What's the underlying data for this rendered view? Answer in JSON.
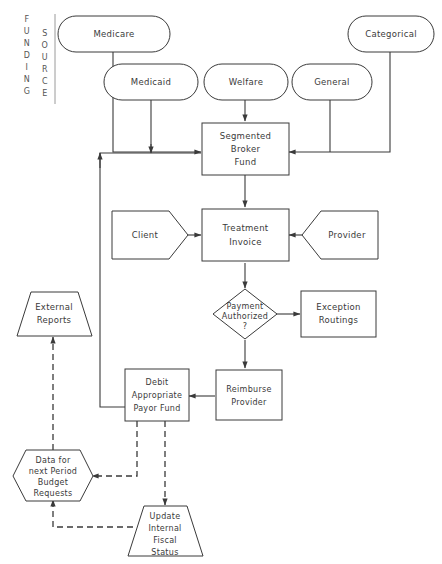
{
  "diagram": {
    "banner": {
      "line1": "FUNDING",
      "line2": "SOURCE"
    },
    "colors": {
      "stroke": "#3a3a3a",
      "fill": "#ffffff",
      "banner_text": "#555555"
    },
    "nodes": {
      "medicare": {
        "label": "Medicare",
        "shape": "pill"
      },
      "medicaid": {
        "label": "Medicaid",
        "shape": "pill"
      },
      "welfare": {
        "label": "Welfare",
        "shape": "pill"
      },
      "general": {
        "label": "General",
        "shape": "pill"
      },
      "categorical": {
        "label": "Categorical",
        "shape": "pill"
      },
      "segmented_broker_fund": {
        "line1": "Segmented",
        "line2": "Broker",
        "line3": "Fund",
        "shape": "rectangle"
      },
      "client": {
        "label": "Client",
        "shape": "pentagon-right"
      },
      "treatment_invoice": {
        "line1": "Treatment",
        "line2": "Invoice",
        "shape": "rectangle"
      },
      "provider": {
        "label": "Provider",
        "shape": "pentagon-left"
      },
      "payment_authorized": {
        "line1": "Payment",
        "line2": "Authorized",
        "line3": "?",
        "shape": "diamond"
      },
      "exception_routings": {
        "line1": "Exception",
        "line2": "Routings",
        "shape": "rectangle"
      },
      "external_reports": {
        "line1": "External",
        "line2": "Reports",
        "shape": "trapezoid"
      },
      "debit_payor_fund": {
        "line1": "Debit",
        "line2": "Appropriate",
        "line3": "Payor Fund",
        "shape": "rectangle"
      },
      "reimburse_provider": {
        "line1": "Reimburse",
        "line2": "Provider",
        "shape": "rectangle"
      },
      "budget_requests": {
        "line1": "Data for",
        "line2": "next Period",
        "line3": "Budget",
        "line4": "Requests",
        "shape": "hexagon"
      },
      "update_fiscal_status": {
        "line1": "Update",
        "line2": "Internal",
        "line3": "Fiscal",
        "line4": "Status",
        "shape": "trapezoid"
      }
    }
  }
}
